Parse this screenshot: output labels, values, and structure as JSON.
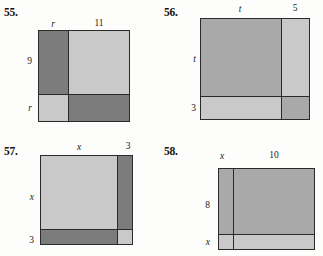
{
  "page": {
    "width": 323,
    "height": 256,
    "background": "#fdfdfb",
    "colors": {
      "dark_gray": "#7c7c7c",
      "light_gray": "#c9c9c9",
      "mid_gray": "#a9a9a9",
      "line": "#2a2a2a",
      "text": "#1a1a1a"
    }
  },
  "problems": [
    {
      "number": "55.",
      "figure_type": "area-model-square",
      "top_labels": [
        "r",
        "11"
      ],
      "left_labels": [
        "9",
        "r"
      ],
      "regions": [
        {
          "name": "top-left",
          "shade": "dark",
          "width_label": "r",
          "height_label": "9"
        },
        {
          "name": "top-right",
          "shade": "light",
          "width_label": "11",
          "height_label": "9"
        },
        {
          "name": "bottom-left",
          "shade": "light",
          "width_label": "r",
          "height_label": "r"
        },
        {
          "name": "bottom-right",
          "shade": "dark",
          "width_label": "11",
          "height_label": "r"
        }
      ]
    },
    {
      "number": "56.",
      "figure_type": "area-model-square",
      "top_labels": [
        "t",
        "5"
      ],
      "left_labels": [
        "t",
        "3"
      ],
      "regions": [
        {
          "name": "top-left",
          "shade": "mid",
          "width_label": "t",
          "height_label": "t"
        },
        {
          "name": "top-right",
          "shade": "light",
          "width_label": "5",
          "height_label": "t"
        },
        {
          "name": "bottom-left",
          "shade": "light",
          "width_label": "t",
          "height_label": "3"
        },
        {
          "name": "bottom-right",
          "shade": "mid",
          "width_label": "5",
          "height_label": "3"
        }
      ]
    },
    {
      "number": "57.",
      "figure_type": "area-model-square",
      "top_labels": [
        "x",
        "3"
      ],
      "left_labels": [
        "x",
        "3"
      ],
      "regions": [
        {
          "name": "top-left",
          "shade": "light",
          "width_label": "x",
          "height_label": "x"
        },
        {
          "name": "top-right",
          "shade": "dark",
          "width_label": "3",
          "height_label": "x"
        },
        {
          "name": "bottom-left",
          "shade": "dark",
          "width_label": "x",
          "height_label": "3"
        },
        {
          "name": "bottom-right",
          "shade": "light",
          "width_label": "3",
          "height_label": "3"
        }
      ]
    },
    {
      "number": "58.",
      "figure_type": "area-model-square",
      "top_labels": [
        "x",
        "10"
      ],
      "left_labels": [
        "8",
        "x"
      ],
      "regions": [
        {
          "name": "top-left",
          "shade": "mid",
          "width_label": "x",
          "height_label": "8"
        },
        {
          "name": "top-right",
          "shade": "mid",
          "width_label": "10",
          "height_label": "8"
        },
        {
          "name": "bottom-left",
          "shade": "light",
          "width_label": "x",
          "height_label": "x"
        },
        {
          "name": "bottom-right",
          "shade": "light",
          "width_label": "10",
          "height_label": "x"
        }
      ]
    }
  ]
}
